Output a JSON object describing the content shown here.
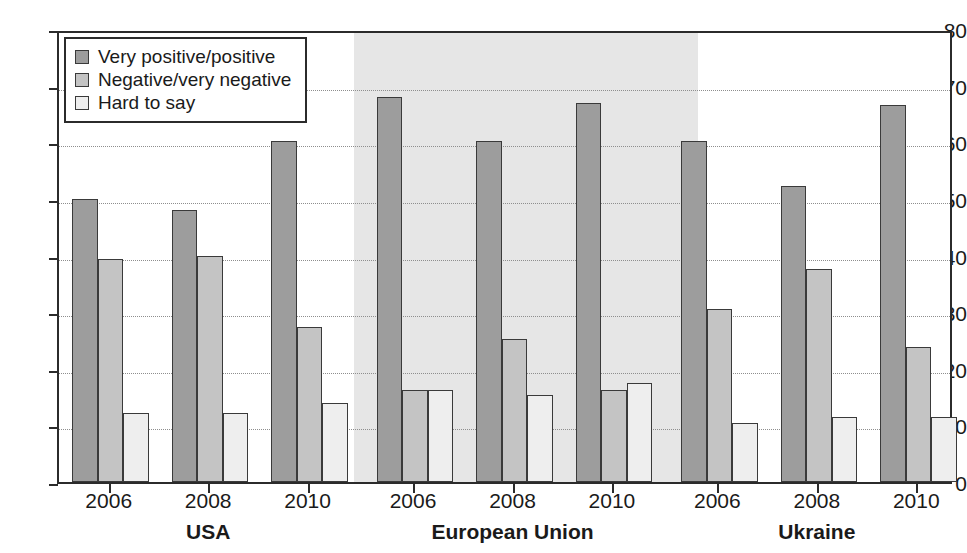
{
  "chart_data": {
    "type": "bar",
    "title": "",
    "subtitle": "",
    "xlabel": "",
    "ylabel": "",
    "ylim": [
      0,
      80
    ],
    "y_ticks": [
      0,
      10,
      20,
      30,
      40,
      50,
      60,
      70,
      80
    ],
    "grid": true,
    "legend_position": "top-left",
    "groups": [
      "USA",
      "European Union",
      "Ukraine"
    ],
    "categories": [
      "2006",
      "2008",
      "2010",
      "2006",
      "2008",
      "2010",
      "2006",
      "2008",
      "2010"
    ],
    "series": [
      {
        "name": "Very positive/positive",
        "color": "#9d9d9d",
        "values": [
          50.0,
          48.0,
          60.2,
          68.0,
          60.3,
          67.0,
          60.3,
          52.3,
          66.6
        ]
      },
      {
        "name": "Negative/very negative",
        "color": "#c4c4c4",
        "values": [
          39.4,
          40.0,
          27.3,
          16.2,
          25.3,
          16.2,
          30.5,
          37.6,
          23.8
        ]
      },
      {
        "name": "Hard to say",
        "color": "#eeeeee",
        "values": [
          12.2,
          12.2,
          14.0,
          16.2,
          15.3,
          17.5,
          10.5,
          11.5,
          11.5
        ]
      }
    ],
    "highlighted_group": "European Union",
    "highlight_color": "#e6e6e6"
  }
}
